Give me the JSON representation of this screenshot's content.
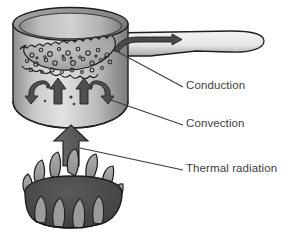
{
  "figure": {
    "background_color": "#ffffff",
    "line_color": "#1c1c1c",
    "text_color": "#3d3d3d"
  },
  "labels": {
    "conduction": "Conduction",
    "convection": "Convection",
    "thermal_radiation": "Thermal radiation"
  },
  "objects": {
    "pot": {
      "name": "saucepan",
      "body_fill_light": "#d8d8d8",
      "body_fill_dark": "#7e7e7e",
      "rim_fill_light": "#b8b8b8",
      "rim_fill_dark": "#6f6f6f"
    },
    "handle": {
      "name": "pan-handle",
      "fill_light": "#efefef",
      "fill_dark": "#b4b4b4"
    },
    "water": {
      "name": "boiling-water-surface",
      "fill": "#b0b0b0",
      "bubble_count": 34
    },
    "burner": {
      "name": "gas-burner-flame",
      "burner_fill": "#4a4a4a",
      "flame_fill": "#9a9a9a",
      "flame_count": 11
    },
    "arrows": {
      "conduction_arrow": "curved-right-arrow-in-handle",
      "convection_arrows": "two-up-arrows-two-curved-down-arrows",
      "radiation_arrow": "large-up-arrow-below-pot",
      "fill": "#555555"
    }
  }
}
